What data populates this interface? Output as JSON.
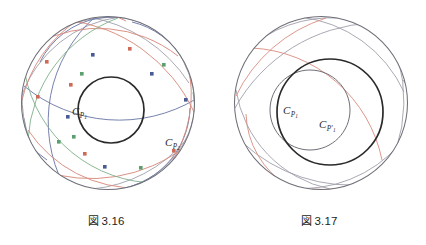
{
  "page": {
    "background": "#ffffff",
    "width": 426,
    "height": 245,
    "kind": "two-panel-mathematical-figure"
  },
  "palette": {
    "ink": "#231f20",
    "boundary_circle": "#6f6f78",
    "bold_circle": "#2a2a2a",
    "thin_gray_arc": "#9a9aa6",
    "blue_arc": "#6f7ba8",
    "red_arc": "#d98b7e",
    "green_arc": "#7fb08a",
    "node_blue": "#4a5a96",
    "node_red": "#d06a58",
    "node_green": "#5aa06e",
    "label_text": "#2b2b2b"
  },
  "figures": [
    {
      "id": "figure-3-16",
      "caption_mark": "図",
      "caption_number": "3.16",
      "caption": "図 3.16",
      "boundary": {
        "cx": 108,
        "cy": 103,
        "r": 87
      },
      "bold_circle": {
        "cx": 111,
        "cy": 110,
        "r": 33,
        "label": "C_P1"
      },
      "labels": [
        {
          "name": "label-c-p1",
          "main": "C",
          "sub": "P",
          "sub2": "1",
          "x": 72,
          "y": 115
        },
        {
          "name": "label-c-p2",
          "main": "C",
          "sub": "P",
          "sub2": "2",
          "x": 165,
          "y": 146
        }
      ],
      "arc_count": 28,
      "node_count": 16,
      "description": "Poincare disk with family of geodesic circular arcs in blue, red and green crossing at marked square nodes, enclosing an inner bold circle"
    },
    {
      "id": "figure-3-17",
      "caption_mark": "図",
      "caption_number": "3.17",
      "caption": "図 3.17",
      "boundary": {
        "cx": 321,
        "cy": 103,
        "r": 87
      },
      "bold_circle": {
        "cx": 330,
        "cy": 112,
        "r": 53,
        "label": "C_P1"
      },
      "gray_circle": {
        "cx": 310,
        "cy": 110,
        "r": 40,
        "label": "C_P1prime"
      },
      "labels": [
        {
          "name": "label-c-p1",
          "main": "C",
          "sub": "P",
          "sub2": "1",
          "x": 283,
          "y": 114
        },
        {
          "name": "label-c-p1-prime",
          "main": "C",
          "sub": "P'",
          "sub2": "1",
          "x": 319,
          "y": 128
        }
      ],
      "arc_count": 22,
      "node_count": 0,
      "description": "Poincare disk with sparse pale geodesic arcs, a bold inner circle and an overlapping lighter circle"
    }
  ]
}
